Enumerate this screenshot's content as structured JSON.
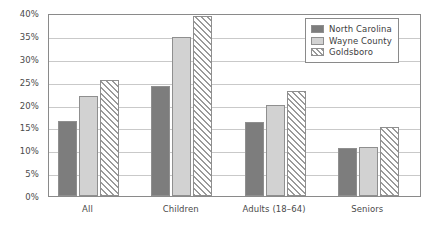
{
  "chart_data": {
    "type": "bar",
    "title": "",
    "subtitle": "",
    "xlabel": "",
    "ylabel": "",
    "categories": [
      "All",
      "Children",
      "Adults (18–64)",
      "Seniors"
    ],
    "series": [
      {
        "name": "North Carolina",
        "values": [
          16.5,
          24.0,
          16.1,
          10.5
        ],
        "color": "#7d7d7d",
        "fill": "solid-dark-gray"
      },
      {
        "name": "Wayne County",
        "values": [
          21.8,
          34.8,
          19.8,
          10.7
        ],
        "color": "#d2d2d2",
        "fill": "solid-light-gray"
      },
      {
        "name": "Goldsboro",
        "values": [
          25.3,
          39.4,
          22.9,
          15.0
        ],
        "color": "#ffffff",
        "fill": "diagonal-hatch"
      }
    ],
    "ylim": [
      0,
      40
    ],
    "ytick_values": [
      0,
      5,
      10,
      15,
      20,
      25,
      30,
      35,
      40
    ],
    "ytick_labels": [
      "0%",
      "5%",
      "10%",
      "15%",
      "20%",
      "25%",
      "30%",
      "35%",
      "40%"
    ],
    "grid": "horizontal",
    "legend_position": "top-right",
    "value_suffix": "%"
  },
  "legend": {
    "entries": [
      {
        "label": "North Carolina"
      },
      {
        "label": "Wayne County"
      },
      {
        "label": "Goldsboro"
      }
    ]
  },
  "colors": {
    "series_north_carolina": "#7d7d7d",
    "series_wayne_county": "#d2d2d2",
    "series_goldsboro": "#ffffff",
    "hatch": "#9a9a9a",
    "gridline": "#c9c9c9",
    "axis": "#8a8a8a",
    "text": "#4a4a4a",
    "background": "#ffffff"
  }
}
